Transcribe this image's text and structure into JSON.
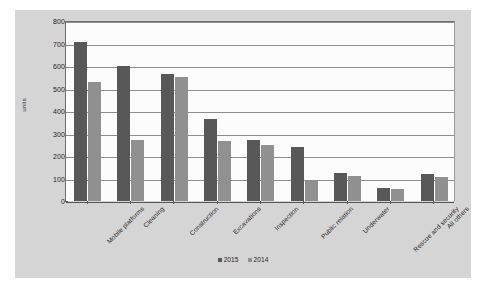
{
  "chart_data": {
    "type": "bar",
    "title": "",
    "subtitle": "",
    "xlabel": "",
    "ylabel": "units",
    "ylim": [
      0,
      800
    ],
    "ytick_step": 100,
    "yticks": [
      "800",
      "700",
      "600",
      "500",
      "400",
      "300",
      "200",
      "100",
      "0"
    ],
    "grid": true,
    "legend_position": "bottom",
    "categories": [
      "Mobile platforms",
      "Cleaning",
      "Construction",
      "Excavations",
      "Inspection",
      "Public relation",
      "Underwater",
      "Rescue and security",
      "All others"
    ],
    "series": [
      {
        "name": "2015",
        "color": "#585858",
        "values": [
          705,
          600,
          565,
          365,
          270,
          240,
          125,
          60,
          118
        ]
      },
      {
        "name": "2014",
        "color": "#909090",
        "values": [
          530,
          272,
          550,
          268,
          250,
          95,
          112,
          55,
          108
        ]
      }
    ]
  },
  "legend": {
    "items": [
      {
        "label": "2015"
      },
      {
        "label": "2014"
      }
    ]
  },
  "colors": {
    "series_2015": "#585858",
    "series_2014": "#909090",
    "chart_background": "#d5d5d5",
    "plot_background": "#fcfcfc",
    "gridline": "#8d8d8d",
    "axis": "#5a5a5a"
  }
}
